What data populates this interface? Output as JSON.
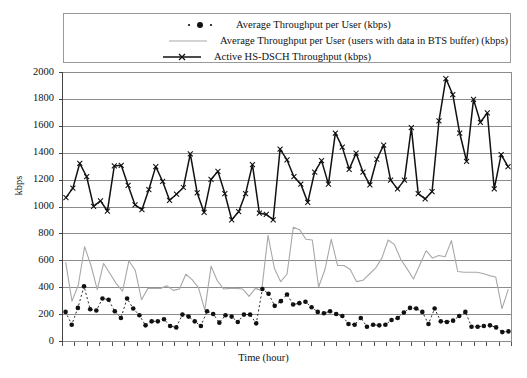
{
  "chart_data": {
    "type": "line",
    "title": "",
    "xlabel": "Time (hour)",
    "ylabel": "kbps",
    "ylim": [
      0,
      2000
    ],
    "yticks": [
      0,
      200,
      400,
      600,
      800,
      1000,
      1200,
      1400,
      1600,
      1800,
      2000
    ],
    "ytick_labels": [
      "0",
      "200",
      "400",
      "600",
      "800",
      "1000",
      "1200",
      "1400",
      "1600",
      "1800",
      "2000"
    ],
    "grid": true,
    "xtick_labels": [],
    "xtick_count": 36,
    "legend_position": "top-inside",
    "n_points": 72,
    "series": [
      {
        "name": "Average Throughput per User (kbps)",
        "style": "dotted-markers",
        "color": "#111111",
        "values": [
          220,
          125,
          250,
          410,
          240,
          230,
          320,
          310,
          225,
          175,
          320,
          245,
          195,
          120,
          150,
          150,
          165,
          115,
          105,
          200,
          185,
          150,
          115,
          225,
          205,
          140,
          195,
          185,
          145,
          200,
          200,
          135,
          390,
          355,
          265,
          300,
          350,
          275,
          285,
          295,
          255,
          220,
          210,
          225,
          205,
          190,
          130,
          125,
          175,
          110,
          125,
          120,
          125,
          160,
          175,
          215,
          250,
          245,
          220,
          130,
          245,
          150,
          145,
          155,
          190,
          220,
          110,
          110,
          115,
          120,
          105,
          70,
          75
        ]
      },
      {
        "name": "Average Throughput per User (users with data in BTS buffer) (kbps)",
        "style": "solid-thin",
        "color": "#a8a8a8",
        "values": [
          590,
          300,
          420,
          705,
          565,
          385,
          580,
          505,
          430,
          375,
          600,
          530,
          310,
          395,
          395,
          395,
          415,
          380,
          390,
          500,
          460,
          400,
          235,
          560,
          450,
          390,
          395,
          395,
          390,
          335,
          395,
          380,
          790,
          545,
          445,
          500,
          850,
          830,
          760,
          755,
          405,
          535,
          760,
          565,
          565,
          535,
          445,
          455,
          500,
          545,
          620,
          755,
          720,
          610,
          540,
          465,
          570,
          675,
          620,
          640,
          630,
          750,
          520,
          515,
          515,
          515,
          505,
          490,
          480,
          245,
          390
        ]
      },
      {
        "name": "Active HS-DSCH Throughput (kbps)",
        "style": "solid-thick-x",
        "color": "#111111",
        "values": [
          1070,
          1140,
          1325,
          1225,
          1005,
          1045,
          970,
          1305,
          1310,
          1160,
          1015,
          980,
          1130,
          1300,
          1190,
          1050,
          1095,
          1145,
          1395,
          1105,
          960,
          1205,
          1265,
          1100,
          905,
          965,
          1100,
          1315,
          955,
          945,
          905,
          1430,
          1350,
          1225,
          1170,
          1035,
          1260,
          1345,
          1170,
          1550,
          1445,
          1280,
          1400,
          1260,
          1165,
          1355,
          1460,
          1200,
          1135,
          1200,
          1590,
          1100,
          1060,
          1115,
          1640,
          1955,
          1835,
          1550,
          1340,
          1800,
          1630,
          1700,
          1135,
          1390,
          1300
        ]
      }
    ]
  },
  "legend": {
    "items": [
      {
        "label": "Average Throughput per User (kbps)",
        "sample": "dotted-marker-sample"
      },
      {
        "label": "Average Throughput per User (users with data in BTS buffer) (kbps)",
        "sample": "gray-line-sample"
      },
      {
        "label": "Active HS-DSCH Throughput (kbps)",
        "sample": "black-x-line-sample"
      }
    ]
  },
  "axes": {
    "y_label": "kbps",
    "x_label": "Time (hour)"
  },
  "colors": {
    "series_dotted": "#111111",
    "series_gray": "#a8a8a8",
    "series_black": "#111111",
    "gridline": "#8c8c8c",
    "axis": "#555555",
    "legend_border": "#9a9a9a"
  }
}
